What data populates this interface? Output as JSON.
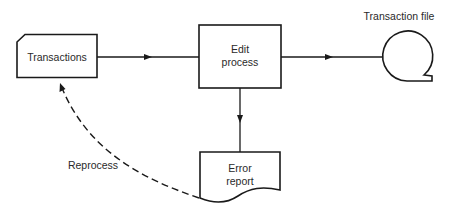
{
  "diagram": {
    "type": "flowchart",
    "nodes": [
      {
        "id": "transactions",
        "shape": "card",
        "lines": [
          "Transactions"
        ]
      },
      {
        "id": "edit-process",
        "shape": "process",
        "lines": [
          "Edit",
          "process"
        ]
      },
      {
        "id": "transaction-file",
        "shape": "magnetic-tape",
        "label": "Transaction file"
      },
      {
        "id": "error-report",
        "shape": "document",
        "lines": [
          "Error",
          "report"
        ]
      }
    ],
    "edges": [
      {
        "from": "transactions",
        "to": "edit-process",
        "style": "solid"
      },
      {
        "from": "edit-process",
        "to": "transaction-file",
        "style": "solid"
      },
      {
        "from": "edit-process",
        "to": "error-report",
        "style": "solid"
      },
      {
        "from": "error-report",
        "to": "transactions",
        "style": "dashed",
        "label": "Reprocess"
      }
    ]
  },
  "labels": {
    "transactions": "Transactions",
    "edit_line1": "Edit",
    "edit_line2": "process",
    "transaction_file": "Transaction file",
    "error_line1": "Error",
    "error_line2": "report",
    "reprocess": "Reprocess"
  }
}
